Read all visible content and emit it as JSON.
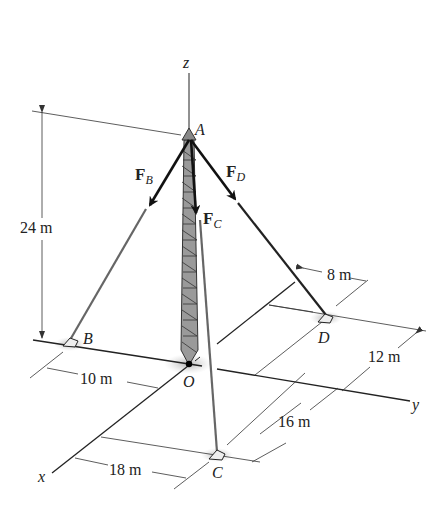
{
  "figure": {
    "axes": {
      "x": "x",
      "y": "y",
      "z": "z"
    },
    "points": {
      "A": "A",
      "B": "B",
      "C": "C",
      "D": "D",
      "O": "O"
    },
    "forces": {
      "FB": {
        "main": "F",
        "sub": "B"
      },
      "FC": {
        "main": "F",
        "sub": "C"
      },
      "FD": {
        "main": "F",
        "sub": "D"
      }
    },
    "dimensions": {
      "height": "24 m",
      "OB": "10 m",
      "Dx": "8 m",
      "Dy": "12 m",
      "Cy": "16 m",
      "Cx": "18 m"
    },
    "colors": {
      "line": "#222222",
      "cable": "#555555",
      "tower": "#444444",
      "shadow": "#bbbbbb"
    }
  }
}
